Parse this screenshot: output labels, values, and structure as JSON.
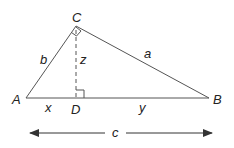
{
  "diagram": {
    "vertices": {
      "A": {
        "label": "A",
        "x": 26,
        "y": 98
      },
      "B": {
        "label": "B",
        "x": 209,
        "y": 98
      },
      "C": {
        "label": "C",
        "x": 76,
        "y": 26
      },
      "D": {
        "label": "D",
        "x": 76,
        "y": 98
      }
    },
    "side_labels": {
      "a": "a",
      "b": "b",
      "c": "c",
      "x": "x",
      "y": "y",
      "z": "z"
    },
    "colors": {
      "line": "#555555",
      "text": "#222222",
      "background": "#ffffff"
    }
  }
}
